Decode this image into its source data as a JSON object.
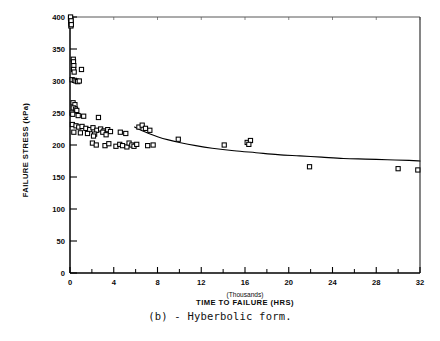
{
  "figure": {
    "caption": "(b) - Hyberbolic form."
  },
  "chart_data": {
    "type": "scatter",
    "title": "",
    "xlabel": "TIME TO FAILURE (HRS)",
    "xlabel_sub": "(Thousands)",
    "ylabel": "FAILURE STRESS (kPa)",
    "xlim": [
      0,
      32
    ],
    "ylim": [
      0,
      400
    ],
    "xticks": [
      0,
      4,
      8,
      12,
      16,
      20,
      24,
      28,
      32
    ],
    "xtick_labels": [
      "0",
      "4",
      "8",
      "12",
      "16",
      "20",
      "24",
      "28",
      "32"
    ],
    "xminor_step": 2,
    "yticks": [
      0,
      50,
      100,
      150,
      200,
      250,
      300,
      350,
      400
    ],
    "ytick_labels": [
      "0",
      "50",
      "100",
      "150",
      "200",
      "250",
      "300",
      "350",
      "400"
    ],
    "grid": false,
    "legend": "none",
    "marker": "open-square",
    "marker_color": "#000000",
    "curve_color": "#000000",
    "series": [
      {
        "name": "Failure data",
        "marker": "open-square",
        "points": [
          [
            0.05,
            398
          ],
          [
            0.07,
            396
          ],
          [
            0.06,
            392
          ],
          [
            0.09,
            390
          ],
          [
            0.08,
            386
          ],
          [
            0.05,
            400
          ],
          [
            0.1,
            394
          ],
          [
            0.12,
            388
          ],
          [
            0.3,
            334
          ],
          [
            0.32,
            330
          ],
          [
            0.35,
            324
          ],
          [
            0.33,
            318
          ],
          [
            0.38,
            314
          ],
          [
            1.05,
            318
          ],
          [
            0.2,
            302
          ],
          [
            0.4,
            301
          ],
          [
            0.55,
            300
          ],
          [
            0.7,
            299
          ],
          [
            0.85,
            300
          ],
          [
            0.28,
            266
          ],
          [
            0.45,
            263
          ],
          [
            0.3,
            258
          ],
          [
            0.5,
            256
          ],
          [
            0.62,
            254
          ],
          [
            0.18,
            250
          ],
          [
            0.25,
            248
          ],
          [
            0.75,
            246
          ],
          [
            1.25,
            245
          ],
          [
            2.6,
            243
          ],
          [
            0.22,
            232
          ],
          [
            0.55,
            230
          ],
          [
            0.8,
            228
          ],
          [
            1.1,
            229
          ],
          [
            1.45,
            226
          ],
          [
            1.8,
            224
          ],
          [
            2.1,
            227
          ],
          [
            2.45,
            223
          ],
          [
            2.8,
            225
          ],
          [
            3.1,
            222
          ],
          [
            3.45,
            224
          ],
          [
            3.7,
            221
          ],
          [
            0.35,
            220
          ],
          [
            0.95,
            219
          ],
          [
            1.6,
            218
          ],
          [
            2.25,
            217
          ],
          [
            3.0,
            220
          ],
          [
            3.3,
            216
          ],
          [
            4.6,
            220
          ],
          [
            5.1,
            218
          ],
          [
            2.15,
            214
          ],
          [
            2.05,
            203
          ],
          [
            2.4,
            200
          ],
          [
            3.2,
            199
          ],
          [
            3.55,
            202
          ],
          [
            4.2,
            198
          ],
          [
            4.55,
            201
          ],
          [
            4.8,
            199
          ],
          [
            5.2,
            197
          ],
          [
            5.4,
            203
          ],
          [
            5.65,
            200
          ],
          [
            5.85,
            198
          ],
          [
            6.1,
            201
          ],
          [
            6.3,
            228
          ],
          [
            6.6,
            231
          ],
          [
            6.9,
            226
          ],
          [
            7.3,
            223
          ],
          [
            7.1,
            199
          ],
          [
            7.6,
            200
          ],
          [
            9.9,
            209
          ],
          [
            14.1,
            200
          ],
          [
            16.2,
            204
          ],
          [
            16.5,
            207
          ],
          [
            16.35,
            201
          ],
          [
            21.9,
            166
          ],
          [
            30.0,
            163
          ],
          [
            31.8,
            161
          ]
        ]
      }
    ],
    "fit_curve": {
      "name": "Hyperbolic fit",
      "points": [
        [
          5.9,
          228
        ],
        [
          6.5,
          223
        ],
        [
          7.2,
          218
        ],
        [
          8.0,
          213
        ],
        [
          9.0,
          208
        ],
        [
          10.0,
          204
        ],
        [
          11.5,
          199
        ],
        [
          13.0,
          195
        ],
        [
          15.0,
          191
        ],
        [
          17.0,
          188
        ],
        [
          19.0,
          185
        ],
        [
          21.0,
          183
        ],
        [
          23.0,
          181
        ],
        [
          25.0,
          179
        ],
        [
          27.0,
          178
        ],
        [
          29.0,
          177
        ],
        [
          31.0,
          176
        ],
        [
          32.0,
          175
        ]
      ]
    }
  }
}
